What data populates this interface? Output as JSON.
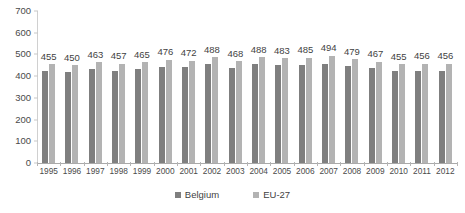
{
  "chart_data": {
    "type": "bar",
    "title": "",
    "subtitle": "",
    "xlabel": "",
    "ylabel": "",
    "ylim": [
      0,
      700
    ],
    "ytick_step": 100,
    "yticks": [
      0,
      100,
      200,
      300,
      400,
      500,
      600,
      700
    ],
    "grid": false,
    "legend_position": "bottom",
    "categories": [
      "1995",
      "1996",
      "1997",
      "1998",
      "1999",
      "2000",
      "2001",
      "2002",
      "2003",
      "2004",
      "2005",
      "2006",
      "2007",
      "2008",
      "2009",
      "2010",
      "2011",
      "2012"
    ],
    "series": [
      {
        "name": "Belgium",
        "color": "#7f7f7f",
        "values": [
          424,
          420,
          432,
          425,
          433,
          444,
          441,
          454,
          437,
          455,
          450,
          452,
          458,
          447,
          437,
          424,
          423,
          423
        ]
      },
      {
        "name": "EU-27",
        "color": "#b3b3b3",
        "values": [
          455,
          450,
          463,
          457,
          465,
          476,
          472,
          488,
          468,
          488,
          483,
          485,
          494,
          479,
          467,
          455,
          456,
          456
        ]
      }
    ],
    "data_labels": {
      "series": "EU-27",
      "values": [
        455,
        450,
        463,
        457,
        465,
        476,
        472,
        488,
        468,
        488,
        483,
        485,
        494,
        479,
        467,
        455,
        456,
        456
      ]
    }
  },
  "legend": {
    "items": [
      {
        "label": "Belgium",
        "color": "#7f7f7f"
      },
      {
        "label": "EU-27",
        "color": "#b3b3b3"
      }
    ]
  },
  "colors": {
    "belgium": "#7f7f7f",
    "eu27": "#b3b3b3",
    "axis": "#aaaaaa",
    "text": "#3f3f3f",
    "background": "#ffffff"
  }
}
